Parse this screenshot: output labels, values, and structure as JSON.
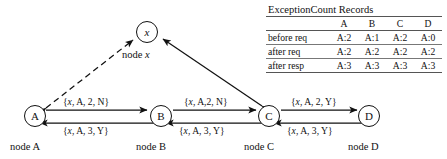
{
  "figure": {
    "nodes": [
      {
        "id": "x",
        "label": "x",
        "caption_prefix": "node ",
        "caption_symbol": "x"
      },
      {
        "id": "A",
        "label": "A",
        "caption": "node A"
      },
      {
        "id": "B",
        "label": "B",
        "caption": "node B"
      },
      {
        "id": "C",
        "label": "C",
        "caption": "node C"
      },
      {
        "id": "D",
        "label": "D",
        "caption": "node D"
      }
    ],
    "edge_labels": {
      "ab_top": "{x, A, 2, N}",
      "ab_bottom": "{x, A, 3, Y}",
      "bc_top": "{x, A,2, N}",
      "bc_bottom": "{x, A, 3, Y}",
      "cd_top": "{x, A, 2, Y}",
      "cd_bottom": "{x, A, 3, Y}"
    },
    "edge_label_parts": {
      "italic_var": "x",
      "ab_top_rest": ", A, 2, N}",
      "ab_bottom_rest": ", A, 3, Y}",
      "bc_top_rest": ", A,2, N}",
      "bc_bottom_rest": ", A, 3, Y}",
      "cd_top_rest": ", A, 2, Y}",
      "cd_bottom_rest": ", A, 3, Y}",
      "open_brace": "{"
    },
    "colors": {
      "stroke": "#111111",
      "rule": "#555555",
      "background": "#ffffff"
    }
  },
  "table": {
    "title": "ExceptionCount Records",
    "columns": [
      "",
      "A",
      "B",
      "C",
      "D"
    ],
    "rows": [
      {
        "label": "before req",
        "values": [
          "A:2",
          "A:1",
          "A:2",
          "A:0"
        ]
      },
      {
        "label": "after req",
        "values": [
          "A:2",
          "A:2",
          "A:2",
          "A:2"
        ]
      },
      {
        "label": "after resp",
        "values": [
          "A:3",
          "A:3",
          "A:3",
          "A:3"
        ]
      }
    ]
  }
}
